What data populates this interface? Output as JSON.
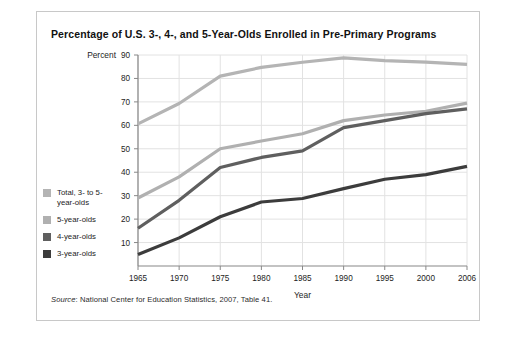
{
  "figure": {
    "title": "Percentage of U.S. 3-, 4-, and 5-Year-Olds Enrolled in Pre-Primary Programs",
    "source_label": "Source",
    "source_text": ": National Center for Education Statistics, 2007, Table 41."
  },
  "colors": {
    "total": "#b4b4b4",
    "five": "#b0b0b0",
    "four": "#5f5f5f",
    "three": "#3c3c3c",
    "grid": "#e2e2e2",
    "axis": "#888888",
    "card_border": "#c8c8c8",
    "text": "#1a1a1a"
  },
  "chart_data": {
    "type": "line",
    "title": "Percentage of U.S. 3-, 4-, and 5-Year-Olds Enrolled in Pre-Primary Programs",
    "xlabel": "Year",
    "ylabel": "Percent",
    "xlim": [
      1965,
      2006
    ],
    "ylim": [
      0,
      90
    ],
    "xticks": [
      1965,
      1970,
      1975,
      1980,
      1985,
      1990,
      1995,
      2000,
      2006
    ],
    "xtick_labels": [
      "1965",
      "1970",
      "1975",
      "1980",
      "1985",
      "1990",
      "1995",
      "2000",
      "2006"
    ],
    "yticks": [
      10,
      20,
      30,
      40,
      50,
      60,
      70,
      80,
      90
    ],
    "ytick_labels": [
      "10",
      "20",
      "30",
      "40",
      "50",
      "60",
      "70",
      "80",
      "90"
    ],
    "grid": true,
    "legend_position": "left-outside",
    "x": [
      1965,
      1970,
      1975,
      1980,
      1985,
      1990,
      1995,
      2000,
      2006
    ],
    "series": [
      {
        "name": "Total, 3- to 5-year-olds",
        "legend_label_line1": "Total, 3- to 5-",
        "legend_label_line2": "year-olds",
        "color": "#b4b4b4",
        "values": [
          60.6,
          69.3,
          81.0,
          84.7,
          86.9,
          88.8,
          87.6,
          87.0,
          86.0
        ]
      },
      {
        "name": "5-year-olds",
        "legend_label_line1": "5-year-olds",
        "legend_label_line2": "",
        "color": "#b0b0b0",
        "values": [
          29.0,
          38.0,
          50.0,
          53.3,
          56.4,
          62.0,
          64.4,
          66.0,
          69.5
        ]
      },
      {
        "name": "4-year-olds",
        "legend_label_line1": "4-year-olds",
        "legend_label_line2": "",
        "color": "#5f5f5f",
        "values": [
          16.1,
          28.0,
          42.0,
          46.3,
          49.1,
          59.0,
          62.0,
          65.0,
          67.0
        ]
      },
      {
        "name": "3-year-olds",
        "legend_label_line1": "3-year-olds",
        "legend_label_line2": "",
        "color": "#3c3c3c",
        "values": [
          4.9,
          12.0,
          21.0,
          27.3,
          28.8,
          33.0,
          37.0,
          39.0,
          42.5
        ]
      }
    ]
  }
}
